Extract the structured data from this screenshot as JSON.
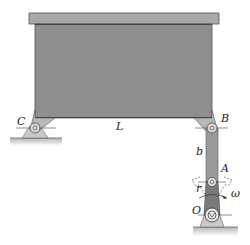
{
  "diagram": {
    "type": "mechanism",
    "labels": {
      "C": "C",
      "L": "L",
      "B": "B",
      "b": "b",
      "A": "A",
      "r": "r",
      "omega": "ω",
      "O": "O"
    },
    "colors": {
      "box_body": "#8e8e8e",
      "box_lid": "#a9a9a9",
      "box_edge": "#555555",
      "bracket": "#b8b8b8",
      "link_AB": "#9a9a9a",
      "crank_OA": "#7a7a7a",
      "ground": "#c4c4c4",
      "support": "#c9c9c9"
    }
  }
}
